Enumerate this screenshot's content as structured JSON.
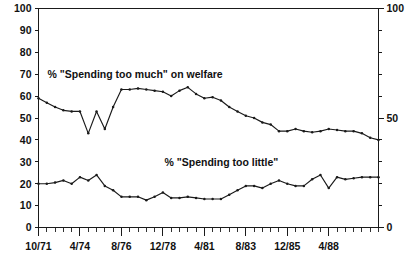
{
  "chart_data": {
    "type": "line",
    "title": "",
    "subtitle": "",
    "xlabel": "",
    "ylabel": "",
    "ylim": [
      0,
      100
    ],
    "grid": false,
    "legend_position": "inline-annotation",
    "y_axis_left": {
      "ticks": [
        0,
        10,
        20,
        30,
        40,
        50,
        60,
        70,
        80,
        90,
        100
      ],
      "tick_labels": [
        "0",
        "10",
        "20",
        "30",
        "40",
        "50",
        "60",
        "70",
        "80",
        "90",
        "100"
      ]
    },
    "y_axis_right": {
      "ticks": [
        0,
        10,
        20,
        30,
        40,
        50,
        60,
        70,
        80,
        90,
        100
      ],
      "labeled_ticks": [
        0,
        50,
        100
      ],
      "tick_labels": [
        "0",
        "50",
        "100"
      ]
    },
    "x_axis": {
      "major_tick_labels": [
        "10/71",
        "4/74",
        "8/76",
        "12/78",
        "4/81",
        "8/83",
        "12/85",
        "4/88"
      ],
      "major_tick_indices": [
        0,
        5,
        10,
        15,
        20,
        25,
        30,
        35
      ],
      "minor_tick_count": 42
    },
    "annotations": [
      {
        "name": "spending-too-much-label",
        "text": "% \"Spending too much\" on welfare",
        "x_index": 1.1,
        "y_value": 70
      },
      {
        "name": "spending-too-little-label",
        "text": "% \"Spending too little\"",
        "x_index": 15.2,
        "y_value": 30
      }
    ],
    "series": [
      {
        "name": "% \"Spending too much\" on welfare",
        "values": [
          59,
          57,
          55,
          53.5,
          53,
          53,
          43,
          53,
          45,
          55,
          63,
          63,
          63.5,
          63,
          62.5,
          62,
          60,
          62.5,
          64,
          61,
          59,
          59.5,
          58,
          55,
          53,
          51,
          50,
          48,
          47,
          44,
          44,
          45,
          44,
          43.5,
          44,
          45,
          44.5,
          44,
          44,
          43,
          41,
          40
        ]
      },
      {
        "name": "% \"Spending too little\"",
        "values": [
          20,
          20,
          20.5,
          21.5,
          20,
          23,
          21.5,
          24,
          19,
          17,
          14,
          14,
          14,
          12.5,
          14,
          16,
          13.5,
          13.5,
          14,
          13.5,
          13,
          13,
          13,
          15,
          17,
          19,
          19,
          18,
          20,
          21.5,
          20,
          19,
          19,
          22,
          24,
          18,
          23,
          22,
          22.5,
          23,
          23,
          23
        ]
      }
    ]
  }
}
